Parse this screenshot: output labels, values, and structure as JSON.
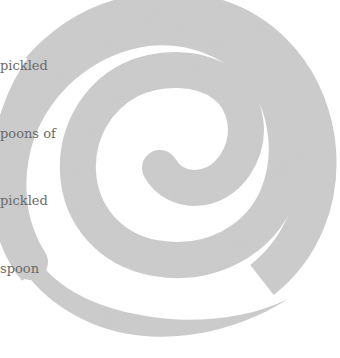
{
  "text_fragment": {
    "lines": [
      "pickled",
      "poons of",
      "pickled",
      "spoon"
    ]
  },
  "graphic": {
    "type": "spiral",
    "color": "#c8c8c8",
    "background": "#ffffff"
  }
}
